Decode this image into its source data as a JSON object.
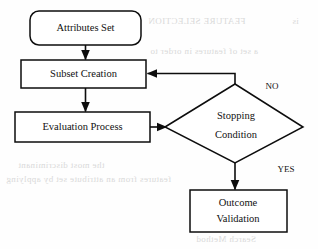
{
  "diagram": {
    "type": "flowchart",
    "canvas": {
      "width": 318,
      "height": 249
    },
    "colors": {
      "stroke": "#0d0d0d",
      "fill": "#ffffff",
      "text": "#111111",
      "bleed_text": "#d9d9d9"
    },
    "nodes": {
      "attributes_set": {
        "label": "Attributes Set",
        "shape": "rounded-rectangle"
      },
      "subset_creation": {
        "label": "Subset Creation",
        "shape": "rectangle"
      },
      "evaluation_process": {
        "label": "Evaluation Process",
        "shape": "rectangle"
      },
      "stopping_condition": {
        "label_line1": "Stopping",
        "label_line2": "Condition",
        "shape": "diamond"
      },
      "outcome_validation": {
        "label_line1": "Outcome",
        "label_line2": "Validation",
        "shape": "rectangle"
      }
    },
    "edge_labels": {
      "no": "NO",
      "yes": "YES"
    }
  },
  "background_bleed": {
    "line1": "FEATURE SELECTION",
    "line2": "is",
    "line3": "a set of features in order to",
    "line4": "the most discriminant",
    "line5": "features from an attribute set by applying",
    "line6": "Search Method"
  }
}
